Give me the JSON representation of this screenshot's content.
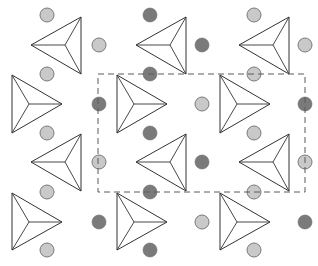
{
  "diagram": {
    "type": "crystal-structure-projection",
    "colors": {
      "background": "#ffffff",
      "line": "#333333",
      "atom_light_fill": "#c9c9c9",
      "atom_light_stroke": "#6e6e6e",
      "atom_dark_fill": "#7a7a7a",
      "cell_line": "#5a5a5a"
    },
    "unit_cell": {
      "x": 98,
      "y": 74,
      "width": 207,
      "height": 118,
      "style": "dashed"
    },
    "triangles": [
      {
        "id": "t1",
        "orientation": "left",
        "apex": [
          31,
          45
        ],
        "v1": [
          81,
          17
        ],
        "v2": [
          81,
          74
        ],
        "center": [
          65,
          45
        ]
      },
      {
        "id": "t2",
        "orientation": "left",
        "apex": [
          136,
          45
        ],
        "v1": [
          186,
          17
        ],
        "v2": [
          186,
          74
        ],
        "center": [
          170,
          45
        ]
      },
      {
        "id": "t3",
        "orientation": "left",
        "apex": [
          239,
          45
        ],
        "v1": [
          289,
          17
        ],
        "v2": [
          289,
          74
        ],
        "center": [
          273,
          45
        ]
      },
      {
        "id": "t4",
        "orientation": "right",
        "apex": [
          62,
          104
        ],
        "v1": [
          12,
          75
        ],
        "v2": [
          12,
          133
        ],
        "center": [
          29,
          104
        ]
      },
      {
        "id": "t5",
        "orientation": "right",
        "apex": [
          167,
          104
        ],
        "v1": [
          117,
          75
        ],
        "v2": [
          117,
          133
        ],
        "center": [
          134,
          104
        ]
      },
      {
        "id": "t6",
        "orientation": "right",
        "apex": [
          270,
          104
        ],
        "v1": [
          220,
          75
        ],
        "v2": [
          220,
          133
        ],
        "center": [
          237,
          104
        ]
      },
      {
        "id": "t7",
        "orientation": "left",
        "apex": [
          31,
          162
        ],
        "v1": [
          81,
          134
        ],
        "v2": [
          81,
          191
        ],
        "center": [
          65,
          162
        ]
      },
      {
        "id": "t8",
        "orientation": "left",
        "apex": [
          136,
          162
        ],
        "v1": [
          186,
          134
        ],
        "v2": [
          186,
          191
        ],
        "center": [
          170,
          162
        ]
      },
      {
        "id": "t9",
        "orientation": "left",
        "apex": [
          239,
          162
        ],
        "v1": [
          289,
          134
        ],
        "v2": [
          289,
          191
        ],
        "center": [
          273,
          162
        ]
      },
      {
        "id": "t10",
        "orientation": "right",
        "apex": [
          62,
          222
        ],
        "v1": [
          12,
          193
        ],
        "v2": [
          12,
          250
        ],
        "center": [
          29,
          222
        ]
      },
      {
        "id": "t11",
        "orientation": "right",
        "apex": [
          167,
          222
        ],
        "v1": [
          117,
          193
        ],
        "v2": [
          117,
          250
        ],
        "center": [
          134,
          222
        ]
      },
      {
        "id": "t12",
        "orientation": "right",
        "apex": [
          270,
          222
        ],
        "v1": [
          220,
          193
        ],
        "v2": [
          220,
          250
        ],
        "center": [
          237,
          222
        ]
      }
    ],
    "atoms": [
      {
        "x": 47,
        "y": 15,
        "kind": "light"
      },
      {
        "x": 150,
        "y": 15,
        "kind": "dark"
      },
      {
        "x": 254,
        "y": 15,
        "kind": "light"
      },
      {
        "x": 99,
        "y": 45,
        "kind": "light"
      },
      {
        "x": 202,
        "y": 45,
        "kind": "dark"
      },
      {
        "x": 305,
        "y": 45,
        "kind": "light"
      },
      {
        "x": 47,
        "y": 74,
        "kind": "light"
      },
      {
        "x": 150,
        "y": 74,
        "kind": "dark"
      },
      {
        "x": 254,
        "y": 74,
        "kind": "light"
      },
      {
        "x": 99,
        "y": 104,
        "kind": "dark"
      },
      {
        "x": 202,
        "y": 104,
        "kind": "light"
      },
      {
        "x": 305,
        "y": 104,
        "kind": "dark"
      },
      {
        "x": 47,
        "y": 133,
        "kind": "light"
      },
      {
        "x": 150,
        "y": 133,
        "kind": "dark"
      },
      {
        "x": 254,
        "y": 133,
        "kind": "light"
      },
      {
        "x": 99,
        "y": 162,
        "kind": "light"
      },
      {
        "x": 202,
        "y": 162,
        "kind": "dark"
      },
      {
        "x": 305,
        "y": 162,
        "kind": "light"
      },
      {
        "x": 47,
        "y": 192,
        "kind": "light"
      },
      {
        "x": 150,
        "y": 192,
        "kind": "dark"
      },
      {
        "x": 254,
        "y": 192,
        "kind": "light"
      },
      {
        "x": 99,
        "y": 222,
        "kind": "dark"
      },
      {
        "x": 202,
        "y": 222,
        "kind": "light"
      },
      {
        "x": 305,
        "y": 222,
        "kind": "dark"
      },
      {
        "x": 47,
        "y": 250,
        "kind": "light"
      },
      {
        "x": 150,
        "y": 250,
        "kind": "dark"
      },
      {
        "x": 254,
        "y": 250,
        "kind": "light"
      }
    ],
    "atom_radius": 7
  }
}
